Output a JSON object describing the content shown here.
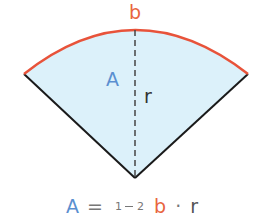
{
  "diagram": {
    "colors": {
      "fill": "#dcf1fa",
      "arc": "#e8533a",
      "radius_sides": "#1a1a1a",
      "dashed_radius": "#444444",
      "area_label": "#5a8fd0",
      "arc_label": "#e8653f",
      "radius_label": "#333333",
      "formula_eq": "#777777"
    },
    "labels": {
      "arc": "b",
      "area": "A",
      "radius": "r"
    },
    "formula": {
      "lhs": "A",
      "equals": "=",
      "frac_num": "1",
      "frac_den": "2",
      "arc": "b",
      "dot": "·",
      "radius": "r"
    }
  }
}
